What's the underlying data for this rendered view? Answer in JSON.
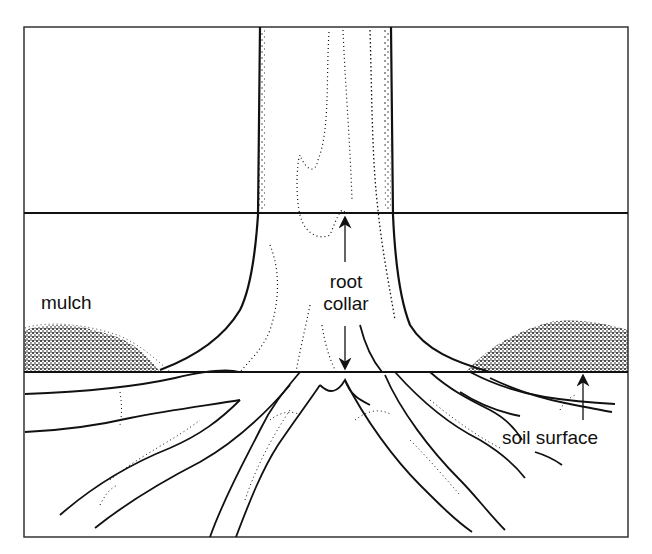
{
  "diagram": {
    "colors": {
      "ink": "#111111",
      "background": "#ffffff",
      "frame": "#333333"
    },
    "labels": {
      "mulch": "mulch",
      "root_collar_line1": "root",
      "root_collar_line2": "collar",
      "soil_surface": "soil surface"
    },
    "reference_lines": [
      {
        "name": "upper-root-collar-line",
        "y": 213
      },
      {
        "name": "soil-surface-line",
        "y": 372
      }
    ],
    "frame": {
      "x": 24,
      "y": 27,
      "width": 604,
      "height": 510
    }
  }
}
